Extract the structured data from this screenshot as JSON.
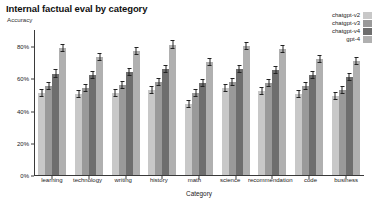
{
  "header": {
    "title": "Internal factual eval by category",
    "subtitle": "Accuracy"
  },
  "chart_data": {
    "type": "bar",
    "title": "Internal factual eval by category",
    "subtitle": "Accuracy",
    "xlabel": "Category",
    "ylabel": "Accuracy",
    "grid": false,
    "legend_position": "top-right",
    "ylim": [
      0,
      90
    ],
    "ytick_labels": [
      "0%",
      "20%",
      "40%",
      "60%",
      "80%"
    ],
    "ytick_values": [
      0,
      20,
      40,
      60,
      80
    ],
    "categories": [
      "learning",
      "technology",
      "writing",
      "history",
      "math",
      "science",
      "recommendation",
      "code",
      "business"
    ],
    "series": [
      {
        "name": "chatgpt-v2",
        "color": "#c8c8c8",
        "values": [
          51,
          50,
          51,
          53,
          44,
          54,
          52,
          50,
          49
        ],
        "errors": [
          2.5,
          2.5,
          2.5,
          2.5,
          2.5,
          2.5,
          2.5,
          2.5,
          2.5
        ]
      },
      {
        "name": "chatgpt-v3",
        "color": "#9a9a9a",
        "values": [
          55,
          54,
          56,
          58,
          51,
          58,
          57,
          55,
          53
        ],
        "errors": [
          2.5,
          2.5,
          2.5,
          2.5,
          2.5,
          2.5,
          2.5,
          2.5,
          2.5
        ]
      },
      {
        "name": "chatgpt-v4",
        "color": "#6e6e6e",
        "values": [
          63,
          62,
          64,
          66,
          57,
          66,
          65,
          62,
          61
        ],
        "errors": [
          2.5,
          2.5,
          2.5,
          2.5,
          2.5,
          2.5,
          2.5,
          2.5,
          2.5
        ]
      },
      {
        "name": "gpt-4",
        "color": "#b0b0b0",
        "values": [
          79,
          73,
          77,
          81,
          70,
          80,
          78,
          72,
          71
        ],
        "errors": [
          2.5,
          2.5,
          2.5,
          2.5,
          2.5,
          2.5,
          2.5,
          2.5,
          2.5
        ]
      }
    ]
  }
}
